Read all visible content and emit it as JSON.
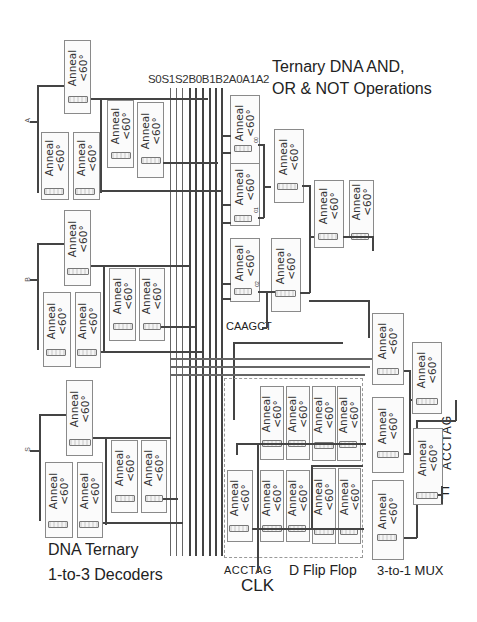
{
  "diagram": {
    "bus_labels": "S0S1S2B0B1B2A0A1A2",
    "title_line1": "Ternary DNA AND,",
    "title_line2": "OR & NOT Operations",
    "decoders_line1": "DNA Ternary",
    "decoders_line2": "1-to-3 Decoders",
    "clk_seq": "ACCTAG",
    "clk_label": "CLK",
    "dff_label": "D Flip Flop",
    "mux_label": "3-to-1 MUX",
    "caagct_label": "CAAGCT",
    "out_seq": "ACCTAG",
    "out_label": "F",
    "inputs": [
      "A",
      "B",
      "S"
    ],
    "port_labels": [
      "00",
      "01",
      "02"
    ],
    "anneal_line1": "Anneal",
    "anneal_line2": "<60°"
  }
}
